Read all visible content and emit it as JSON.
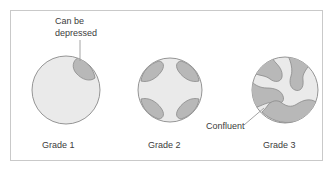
{
  "figure": {
    "frame": {
      "border_color": "#c9c9c9",
      "background": "#ffffff"
    },
    "colors": {
      "organ_fill": "#eaeaea",
      "organ_stroke": "#8a8a8a",
      "lesion_fill": "#b8b8b8",
      "lesion_stroke": "#8a8a8a",
      "text": "#3c3c3c",
      "leader_line": "#9a9a9a"
    }
  },
  "annotations": {
    "can_be_depressed": {
      "line1": "Can be",
      "line2": "depressed"
    },
    "confluent": {
      "label": "Confluent"
    }
  },
  "panels": [
    {
      "id": "grade-1",
      "label": "Grade 1",
      "lesion_count": 1,
      "description": "Single discrete lesion, can be depressed"
    },
    {
      "id": "grade-2",
      "label": "Grade 2",
      "lesion_count": 4,
      "description": "Multiple separate discrete lesions"
    },
    {
      "id": "grade-3",
      "label": "Grade 3",
      "lesion_count": 4,
      "description": "Large merged confluent lesions"
    }
  ]
}
